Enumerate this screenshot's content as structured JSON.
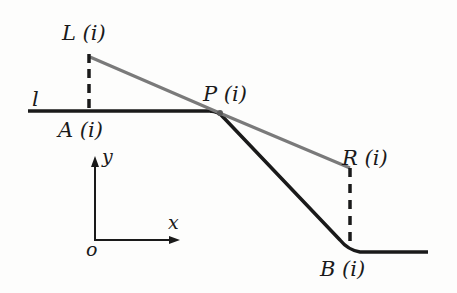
{
  "diagram": {
    "labels": {
      "L": "L (i)",
      "A": "A (i)",
      "P": "P (i)",
      "R": "R (i)",
      "B": "B (i)",
      "line": "l",
      "x_axis": "x",
      "y_axis": "y",
      "origin": "o"
    },
    "colors": {
      "black_line": "#1a1a1a",
      "gray_line": "#7a7a7a",
      "dashed": "#1a1a1a"
    }
  }
}
